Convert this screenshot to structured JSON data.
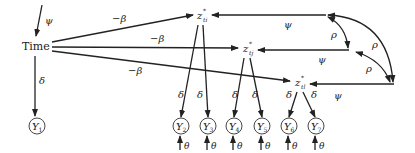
{
  "diagram": {
    "type": "path-diagram",
    "time_node": {
      "label": "Time"
    },
    "time_self_param": "ψ",
    "latent_nodes": [
      {
        "id": "zti",
        "label": "z",
        "sup": "*",
        "sub": "ti"
      },
      {
        "id": "ztj",
        "label": "z",
        "sup": "*",
        "sub": "tj"
      },
      {
        "id": "ztl",
        "label": "z",
        "sup": "*",
        "sub": "tl"
      }
    ],
    "observed_nodes": [
      {
        "id": "Y1",
        "label": "Y",
        "sub": "1"
      },
      {
        "id": "Y2",
        "label": "Y",
        "sub": "2"
      },
      {
        "id": "Y3",
        "label": "Y",
        "sub": "3"
      },
      {
        "id": "Y4",
        "label": "Y",
        "sub": "4"
      },
      {
        "id": "Y5",
        "label": "Y",
        "sub": "5"
      },
      {
        "id": "Y6",
        "label": "Y",
        "sub": "6"
      },
      {
        "id": "Y7",
        "label": "Y",
        "sub": "7"
      }
    ],
    "edge_labels": {
      "time_to_latent": "−β",
      "loading": "δ",
      "disturbance": "ψ",
      "correlation": "ρ",
      "error": "θ"
    },
    "edges": [
      {
        "from": "Time",
        "to": "Y1",
        "label": "δ"
      },
      {
        "from": "Time",
        "to": "zti",
        "label": "−β"
      },
      {
        "from": "Time",
        "to": "ztj",
        "label": "−β"
      },
      {
        "from": "Time",
        "to": "ztl",
        "label": "−β"
      },
      {
        "from": "zti",
        "to": "Y2",
        "label": "δ"
      },
      {
        "from": "zti",
        "to": "Y3",
        "label": "δ"
      },
      {
        "from": "ztj",
        "to": "Y4",
        "label": "δ"
      },
      {
        "from": "ztj",
        "to": "Y5",
        "label": "δ"
      },
      {
        "from": "ztl",
        "to": "Y6",
        "label": "δ"
      },
      {
        "from": "ztl",
        "to": "Y7",
        "label": "δ"
      }
    ],
    "correlations": [
      {
        "between": [
          "zti",
          "ztj"
        ],
        "label": "ρ"
      },
      {
        "between": [
          "zti",
          "ztl"
        ],
        "label": "ρ"
      },
      {
        "between": [
          "ztj",
          "ztl"
        ],
        "label": "ρ"
      }
    ]
  }
}
